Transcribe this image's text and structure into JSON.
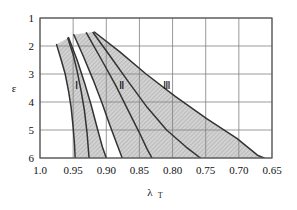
{
  "chart_data": {
    "type": "line",
    "title": "",
    "xlabel": "λ",
    "xlabel_sub": "T",
    "ylabel": "ε",
    "xticks": [
      "1.0",
      "0.95",
      "0.90",
      "0.85",
      "0.80",
      "0.75",
      "0.70",
      "0.65"
    ],
    "xtick_values": [
      1.0,
      0.95,
      0.9,
      0.85,
      0.8,
      0.75,
      0.7,
      0.65
    ],
    "yticks": [
      "1",
      "2",
      "3",
      "4",
      "5",
      "6"
    ],
    "ytick_values": [
      1,
      2,
      3,
      4,
      5,
      6
    ],
    "xlim": [
      1.0,
      0.65
    ],
    "ylim": [
      1,
      6
    ],
    "y_inverted": true,
    "grid": true,
    "legend": "none",
    "annotations": [
      {
        "text": "Ⅰ",
        "x": 0.945,
        "y": 3.55
      },
      {
        "text": "Ⅱ",
        "x": 0.877,
        "y": 3.55
      },
      {
        "text": "Ⅲ",
        "x": 0.808,
        "y": 3.55
      }
    ],
    "series": [
      {
        "name": "curve-1-left-outer",
        "points": [
          [
            0.975,
            1.95
          ],
          [
            0.968,
            2.5
          ],
          [
            0.962,
            3.0
          ],
          [
            0.957,
            3.6
          ],
          [
            0.953,
            4.2
          ],
          [
            0.95,
            4.9
          ],
          [
            0.948,
            5.5
          ],
          [
            0.947,
            6.0
          ]
        ]
      },
      {
        "name": "curve-2-region-I-left",
        "points": [
          [
            0.958,
            1.72
          ],
          [
            0.95,
            2.3
          ],
          [
            0.944,
            2.9
          ],
          [
            0.938,
            3.6
          ],
          [
            0.933,
            4.3
          ],
          [
            0.929,
            5.1
          ],
          [
            0.926,
            6.0
          ]
        ]
      },
      {
        "name": "curve-3-region-I-right",
        "points": [
          [
            0.957,
            1.7
          ],
          [
            0.944,
            2.5
          ],
          [
            0.933,
            3.3
          ],
          [
            0.923,
            4.1
          ],
          [
            0.914,
            4.9
          ],
          [
            0.906,
            5.6
          ],
          [
            0.9,
            6.0
          ]
        ]
      },
      {
        "name": "curve-4-region-II-left",
        "points": [
          [
            0.949,
            1.6
          ],
          [
            0.934,
            2.4
          ],
          [
            0.92,
            3.2
          ],
          [
            0.907,
            4.0
          ],
          [
            0.895,
            4.8
          ],
          [
            0.884,
            5.5
          ],
          [
            0.876,
            6.0
          ]
        ]
      },
      {
        "name": "curve-5-region-II-right",
        "points": [
          [
            0.93,
            1.53
          ],
          [
            0.907,
            2.5
          ],
          [
            0.886,
            3.4
          ],
          [
            0.867,
            4.3
          ],
          [
            0.85,
            5.1
          ],
          [
            0.838,
            5.7
          ],
          [
            0.831,
            6.0
          ]
        ]
      },
      {
        "name": "curve-6-region-III-right-outer",
        "points": [
          [
            0.92,
            1.52
          ],
          [
            0.893,
            2.4
          ],
          [
            0.866,
            3.3
          ],
          [
            0.838,
            4.2
          ],
          [
            0.809,
            5.0
          ],
          [
            0.78,
            5.6
          ],
          [
            0.758,
            6.0
          ]
        ]
      },
      {
        "name": "curve-7-outer-envelope",
        "points": [
          [
            0.918,
            1.5
          ],
          [
            0.88,
            2.2
          ],
          [
            0.84,
            3.0
          ],
          [
            0.796,
            3.8
          ],
          [
            0.748,
            4.6
          ],
          [
            0.703,
            5.3
          ],
          [
            0.672,
            5.9
          ],
          [
            0.662,
            6.0
          ]
        ]
      }
    ],
    "regions": [
      {
        "label": "Ⅰ",
        "shaded": true,
        "hatch": "diagonal"
      },
      {
        "label": "Ⅱ",
        "shaded": true,
        "hatch": "diagonal"
      },
      {
        "label": "Ⅲ",
        "shaded": true,
        "hatch": "diagonal"
      }
    ]
  },
  "colors": {
    "curve": "#333333",
    "grid": "#808080",
    "frame": "#555555",
    "shade": "#c9c9c9",
    "background": "#ffffff"
  }
}
